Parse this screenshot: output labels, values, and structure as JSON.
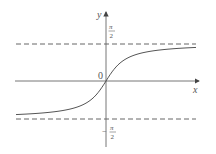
{
  "chart_data": {
    "type": "line",
    "title": "",
    "function": "y = arctan(x)",
    "xlabel": "x",
    "ylabel": "y",
    "origin_label": "0",
    "asymptotes": [
      {
        "label": "π/2",
        "value": 1.5708,
        "style": "dashed"
      },
      {
        "label": "−π/2",
        "value": -1.5708,
        "style": "dashed"
      }
    ],
    "tick_labels": {
      "upper": {
        "num": "π",
        "den": "2",
        "sign": ""
      },
      "lower": {
        "num": "π",
        "den": "2",
        "sign": "−"
      }
    },
    "x": [
      -6,
      -4,
      -3,
      -2,
      -1,
      -0.5,
      0,
      0.5,
      1,
      2,
      3,
      4,
      6
    ],
    "values": [
      -1.406,
      -1.326,
      -1.249,
      -1.107,
      -0.785,
      -0.464,
      0,
      0.464,
      0.785,
      1.107,
      1.249,
      1.326,
      1.406
    ],
    "grid": false,
    "legend": null
  },
  "colors": {
    "axis": "#666666",
    "curve": "#555555",
    "asymptote": "#555555"
  }
}
